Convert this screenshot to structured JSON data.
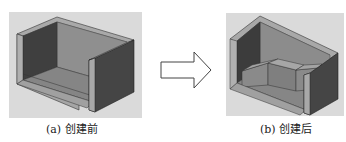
{
  "figure": {
    "panel_a": {
      "caption": "(a) 创建前"
    },
    "panel_b": {
      "caption": "(b) 创建后"
    },
    "arrow": {
      "direction": "right",
      "style": "outline"
    }
  },
  "colors": {
    "background_plate": "#d9d9d9",
    "wall_dark": "#4a4a4a",
    "wall_mid": "#7a7a7a",
    "floor": "#8c8c8c",
    "rim": "#a8a8a8",
    "inner_light": "#9a9a9a",
    "edge": "#2b2b2b",
    "arrow_stroke": "#444444"
  }
}
